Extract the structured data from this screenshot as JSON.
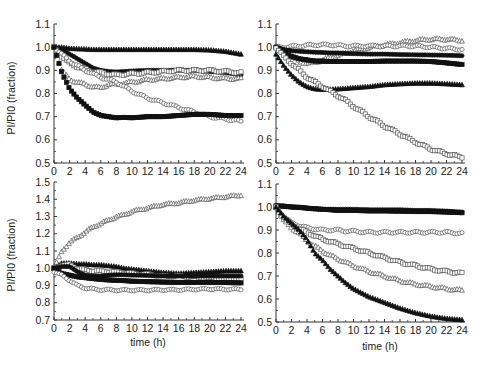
{
  "figure": {
    "ylabel": "PI/PI0  (fraction)",
    "xlabel": "time (h)"
  },
  "chart_data": [
    {
      "type": "scatter",
      "panel": "top-left",
      "title": "",
      "xlabel": "",
      "ylabel": "PI/PI0  (fraction)",
      "xlim": [
        0,
        24
      ],
      "ylim": [
        0.5,
        1.1
      ],
      "xticks": [
        0,
        2,
        4,
        6,
        8,
        10,
        12,
        14,
        16,
        18,
        20,
        22,
        24
      ],
      "yticks": [
        0.5,
        0.6,
        0.7,
        0.8,
        0.9,
        1.0,
        1.1
      ],
      "grid": false,
      "legend": null,
      "x": [
        0,
        1,
        2,
        3,
        4,
        5,
        6,
        7,
        8,
        9,
        10,
        12,
        14,
        16,
        18,
        20,
        22,
        24
      ],
      "series": [
        {
          "name": "filled triangles (top)",
          "marker": "filled-triangle",
          "values": [
            1.0,
            1.0,
            0.995,
            0.993,
            0.992,
            0.99,
            0.99,
            0.99,
            0.99,
            0.99,
            0.99,
            0.99,
            0.99,
            0.99,
            0.99,
            0.988,
            0.982,
            0.97
          ]
        },
        {
          "name": "filled circles",
          "marker": "filled-circle",
          "values": [
            1.0,
            0.99,
            0.97,
            0.95,
            0.93,
            0.91,
            0.9,
            0.895,
            0.893,
            0.895,
            0.897,
            0.9,
            0.9,
            0.9,
            0.9,
            0.895,
            0.89,
            0.88
          ]
        },
        {
          "name": "open squares",
          "marker": "open-square",
          "values": [
            1.0,
            0.96,
            0.93,
            0.915,
            0.905,
            0.895,
            0.89,
            0.885,
            0.88,
            0.883,
            0.885,
            0.89,
            0.895,
            0.9,
            0.9,
            0.9,
            0.895,
            0.89
          ]
        },
        {
          "name": "open triangles",
          "marker": "open-triangle",
          "values": [
            1.0,
            0.9,
            0.86,
            0.85,
            0.84,
            0.83,
            0.825,
            0.84,
            0.84,
            0.845,
            0.85,
            0.86,
            0.865,
            0.87,
            0.875,
            0.87,
            0.865,
            0.865
          ]
        },
        {
          "name": "open circles (declining)",
          "marker": "open-circle",
          "values": [
            1.0,
            0.97,
            0.94,
            0.92,
            0.9,
            0.885,
            0.87,
            0.86,
            0.85,
            0.83,
            0.81,
            0.78,
            0.76,
            0.74,
            0.72,
            0.7,
            0.69,
            0.68
          ]
        },
        {
          "name": "filled squares",
          "marker": "filled-square",
          "values": [
            1.0,
            0.89,
            0.82,
            0.78,
            0.75,
            0.72,
            0.705,
            0.7,
            0.695,
            0.697,
            0.695,
            0.7,
            0.7,
            0.705,
            0.71,
            0.71,
            0.705,
            0.705
          ]
        }
      ]
    },
    {
      "type": "scatter",
      "panel": "top-right",
      "title": "",
      "xlabel": "",
      "ylabel": "",
      "xlim": [
        0,
        24
      ],
      "ylim": [
        0.5,
        1.1
      ],
      "xticks": [
        0,
        2,
        4,
        6,
        8,
        10,
        12,
        14,
        16,
        18,
        20,
        22,
        24
      ],
      "yticks": [
        0.5,
        0.6,
        0.7,
        0.8,
        0.9,
        1.0,
        1.1
      ],
      "grid": false,
      "legend": null,
      "x": [
        0,
        1,
        2,
        3,
        4,
        5,
        6,
        7,
        8,
        9,
        10,
        12,
        14,
        16,
        18,
        20,
        22,
        24
      ],
      "series": [
        {
          "name": "open triangles (rising)",
          "marker": "open-triangle",
          "values": [
            1.0,
            0.98,
            0.96,
            0.94,
            0.93,
            0.935,
            0.945,
            0.955,
            0.965,
            0.975,
            0.985,
            1.0,
            1.01,
            1.02,
            1.03,
            1.035,
            1.035,
            1.03
          ]
        },
        {
          "name": "open circles",
          "marker": "open-circle",
          "values": [
            1.0,
            1.0,
            1.003,
            1.005,
            1.008,
            1.01,
            1.01,
            1.01,
            1.008,
            1.005,
            1.005,
            1.005,
            1.005,
            1.005,
            1.005,
            1.0,
            0.995,
            0.99
          ]
        },
        {
          "name": "filled circles",
          "marker": "filled-circle",
          "values": [
            1.0,
            0.99,
            0.985,
            0.982,
            0.98,
            0.978,
            0.977,
            0.975,
            0.975,
            0.973,
            0.972,
            0.97,
            0.97,
            0.968,
            0.967,
            0.966,
            0.965,
            0.963
          ]
        },
        {
          "name": "filled squares",
          "marker": "filled-square",
          "values": [
            1.0,
            0.98,
            0.96,
            0.95,
            0.945,
            0.94,
            0.94,
            0.938,
            0.938,
            0.938,
            0.938,
            0.938,
            0.94,
            0.94,
            0.94,
            0.938,
            0.932,
            0.925
          ]
        },
        {
          "name": "filled triangles",
          "marker": "filled-triangle",
          "values": [
            0.97,
            0.92,
            0.88,
            0.85,
            0.83,
            0.82,
            0.818,
            0.818,
            0.82,
            0.822,
            0.825,
            0.83,
            0.838,
            0.842,
            0.845,
            0.845,
            0.842,
            0.838
          ]
        },
        {
          "name": "open squares (declining)",
          "marker": "open-square",
          "values": [
            1.0,
            0.96,
            0.93,
            0.9,
            0.87,
            0.85,
            0.83,
            0.81,
            0.79,
            0.77,
            0.745,
            0.7,
            0.66,
            0.625,
            0.59,
            0.56,
            0.54,
            0.525
          ]
        }
      ]
    },
    {
      "type": "scatter",
      "panel": "bottom-left",
      "title": "",
      "xlabel": "time (h)",
      "ylabel": "PI/PI0  (fraction)",
      "xlim": [
        0,
        24
      ],
      "ylim": [
        0.7,
        1.5
      ],
      "xticks": [
        0,
        2,
        4,
        6,
        8,
        10,
        12,
        14,
        16,
        18,
        20,
        22,
        24
      ],
      "yticks": [
        0.7,
        0.8,
        0.9,
        1.0,
        1.1,
        1.2,
        1.3,
        1.4,
        1.5
      ],
      "grid": false,
      "legend": null,
      "x": [
        0,
        1,
        2,
        3,
        4,
        5,
        6,
        7,
        8,
        9,
        10,
        12,
        14,
        16,
        18,
        20,
        22,
        24
      ],
      "series": [
        {
          "name": "open triangles (rising)",
          "marker": "open-triangle",
          "values": [
            1.0,
            1.1,
            1.15,
            1.18,
            1.21,
            1.24,
            1.26,
            1.28,
            1.3,
            1.31,
            1.33,
            1.35,
            1.37,
            1.38,
            1.395,
            1.405,
            1.415,
            1.425
          ]
        },
        {
          "name": "filled triangles",
          "marker": "filled-triangle",
          "values": [
            1.0,
            1.03,
            1.03,
            1.025,
            1.025,
            1.02,
            1.02,
            1.015,
            1.01,
            1.0,
            0.995,
            0.985,
            0.975,
            0.97,
            0.975,
            0.98,
            0.985,
            0.985
          ]
        },
        {
          "name": "open squares",
          "marker": "open-square",
          "values": [
            1.0,
            1.02,
            1.02,
            1.0,
            0.99,
            0.985,
            0.985,
            0.98,
            0.978,
            0.975,
            0.97,
            0.965,
            0.955,
            0.955,
            0.95,
            0.945,
            0.94,
            0.935
          ]
        },
        {
          "name": "filled circles",
          "marker": "filled-circle",
          "values": [
            1.0,
            1.01,
            1.01,
            0.98,
            0.96,
            0.955,
            0.955,
            0.96,
            0.962,
            0.962,
            0.96,
            0.958,
            0.955,
            0.955,
            0.955,
            0.955,
            0.955,
            0.955
          ]
        },
        {
          "name": "filled squares",
          "marker": "filled-square",
          "values": [
            1.0,
            0.97,
            0.96,
            0.95,
            0.945,
            0.94,
            0.935,
            0.932,
            0.93,
            0.928,
            0.925,
            0.922,
            0.92,
            0.918,
            0.918,
            0.918,
            0.917,
            0.915
          ]
        },
        {
          "name": "open circles",
          "marker": "open-circle",
          "values": [
            0.98,
            0.96,
            0.93,
            0.9,
            0.885,
            0.88,
            0.875,
            0.875,
            0.873,
            0.873,
            0.873,
            0.873,
            0.875,
            0.875,
            0.878,
            0.88,
            0.878,
            0.878
          ]
        }
      ]
    },
    {
      "type": "scatter",
      "panel": "bottom-right",
      "title": "",
      "xlabel": "time (h)",
      "ylabel": "",
      "xlim": [
        0,
        24
      ],
      "ylim": [
        0.5,
        1.1
      ],
      "xticks": [
        0,
        2,
        4,
        6,
        8,
        10,
        12,
        14,
        16,
        18,
        20,
        22,
        24
      ],
      "yticks": [
        0.5,
        0.6,
        0.7,
        0.8,
        0.9,
        1.0,
        1.1
      ],
      "grid": false,
      "legend": null,
      "x": [
        0,
        1,
        2,
        3,
        4,
        5,
        6,
        7,
        8,
        9,
        10,
        12,
        14,
        16,
        18,
        20,
        22,
        24
      ],
      "series": [
        {
          "name": "filled circles (flat)",
          "marker": "filled-circle",
          "values": [
            1.005,
            1.005,
            1.0,
            1.0,
            0.995,
            0.993,
            0.99,
            0.99,
            0.99,
            0.99,
            0.99,
            0.988,
            0.988,
            0.988,
            0.985,
            0.985,
            0.982,
            0.978
          ]
        },
        {
          "name": "filled squares (flat)",
          "marker": "filled-square",
          "values": [
            1.005,
            1.003,
            1.0,
            0.998,
            0.995,
            0.992,
            0.99,
            0.988,
            0.985,
            0.985,
            0.985,
            0.983,
            0.983,
            0.982,
            0.98,
            0.98,
            0.978,
            0.975
          ]
        },
        {
          "name": "open circles",
          "marker": "open-circle",
          "values": [
            1.0,
            0.96,
            0.93,
            0.92,
            0.91,
            0.905,
            0.9,
            0.9,
            0.9,
            0.895,
            0.895,
            0.89,
            0.89,
            0.89,
            0.89,
            0.89,
            0.89,
            0.885
          ]
        },
        {
          "name": "open squares",
          "marker": "open-square",
          "values": [
            1.0,
            0.95,
            0.92,
            0.905,
            0.89,
            0.875,
            0.86,
            0.85,
            0.84,
            0.83,
            0.82,
            0.8,
            0.78,
            0.76,
            0.745,
            0.73,
            0.72,
            0.712
          ]
        },
        {
          "name": "open triangles",
          "marker": "open-triangle",
          "values": [
            1.0,
            0.94,
            0.91,
            0.885,
            0.855,
            0.83,
            0.81,
            0.79,
            0.775,
            0.76,
            0.745,
            0.72,
            0.7,
            0.68,
            0.665,
            0.655,
            0.645,
            0.638
          ]
        },
        {
          "name": "filled triangles (declining)",
          "marker": "filled-triangle",
          "values": [
            1.0,
            0.96,
            0.93,
            0.9,
            0.86,
            0.8,
            0.77,
            0.73,
            0.7,
            0.67,
            0.645,
            0.61,
            0.585,
            0.56,
            0.54,
            0.525,
            0.515,
            0.51
          ]
        }
      ]
    }
  ]
}
